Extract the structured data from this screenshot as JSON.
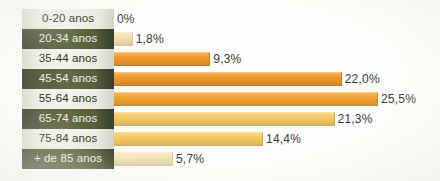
{
  "chart_data": {
    "type": "bar",
    "orientation": "horizontal",
    "title": "",
    "subtitle": "",
    "xlabel": "",
    "ylabel": "",
    "grid": false,
    "legend": null,
    "axis_visible": false,
    "xlim": [
      0,
      25.5
    ],
    "categories": [
      "0-20 anos",
      "20-34 anos",
      "35-44 anos",
      "45-54 anos",
      "55-64 anos",
      "65-74 anos",
      "75-84 anos",
      "+ de 85 anos"
    ],
    "values": [
      0,
      1.8,
      9.3,
      22.0,
      25.5,
      21.3,
      14.4,
      5.7
    ],
    "value_labels": [
      "0%",
      "1,8%",
      "9,3%",
      "22,0%",
      "25,5%",
      "21,3%",
      "14,4%",
      "5,7%"
    ],
    "bar_colors": [
      "#f2e0b4",
      "#f5dfae",
      "#ef9527",
      "#ef9527",
      "#f0a02d",
      "#f4c762",
      "#f5c95f",
      "#f6e3b5"
    ],
    "bar_border_colors": [
      "#d9c290",
      "#ddc58f",
      "#cf7c15",
      "#cf7c15",
      "#d0871b",
      "#d9ab43",
      "#dbad41",
      "#ddc791"
    ],
    "label_styles": [
      "light",
      "dark",
      "light",
      "dark",
      "light",
      "dark",
      "light",
      "dark"
    ]
  },
  "colors": {
    "label_light_bg": "#f3f4ee",
    "label_light_text": "#2c3322",
    "label_dark_bg": "#626a46",
    "label_dark_text": "#f2f3ec",
    "orange": "#ef9527",
    "gold": "#f4c762",
    "cream": "#f6e3b5",
    "page_bg": "#fdfdfb",
    "value_text": "#3a3a38"
  }
}
